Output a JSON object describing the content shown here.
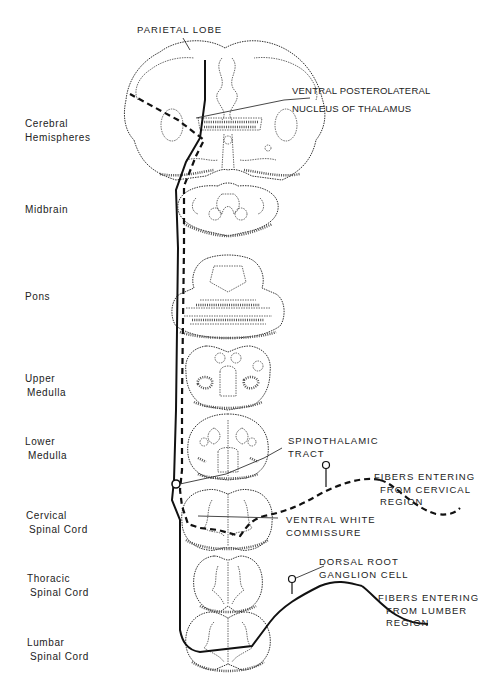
{
  "figure": {
    "levels": [
      {
        "id": "cerebral",
        "label_line1": "Cerebral",
        "label_line2": "Hemispheres"
      },
      {
        "id": "midbrain",
        "label_line1": "Midbrain",
        "label_line2": ""
      },
      {
        "id": "pons",
        "label_line1": "Pons",
        "label_line2": ""
      },
      {
        "id": "upper-medulla",
        "label_line1": "Upper",
        "label_line2": "Medulla"
      },
      {
        "id": "lower-medulla",
        "label_line1": "Lower",
        "label_line2": "Medulla"
      },
      {
        "id": "cervical",
        "label_line1": "Cervical",
        "label_line2": "Spinal Cord"
      },
      {
        "id": "thoracic",
        "label_line1": "Thoracic",
        "label_line2": "Spinal Cord"
      },
      {
        "id": "lumbar",
        "label_line1": "Lumbar",
        "label_line2": "Spinal Cord"
      }
    ],
    "annotations": {
      "parietal_lobe": "PARIETAL  LOBE",
      "vpl_line1": "VENTRAL POSTEROLATERAL",
      "vpl_line2": "NUCLEUS OF THALAMUS",
      "spinothalamic_line1": "SPINOTHALAMIC",
      "spinothalamic_line2": "TRACT",
      "cervical_fibers_line1": "FIBERS  ENTERING",
      "cervical_fibers_line2": "FROM CERVICAL",
      "cervical_fibers_line3": "REGION",
      "ventral_white_line1": "VENTRAL  WHITE",
      "ventral_white_line2": "COMMISSURE",
      "drg_line1": "DORSAL ROOT",
      "drg_line2": "GANGLION  CELL",
      "lumbar_fibers_line1": "FIBERS ENTERING",
      "lumbar_fibers_line2": "FROM LUMBER",
      "lumbar_fibers_line3": "REGION"
    },
    "legend": {
      "solid_line": "Fibers from lumbar region",
      "dashed_line": "Fibers from cervical region"
    },
    "colors": {
      "ink": "#111111",
      "background": "#ffffff"
    }
  }
}
